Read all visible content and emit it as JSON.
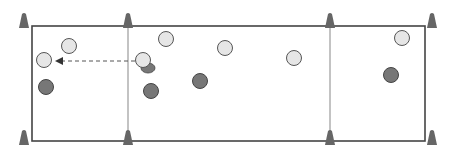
{
  "diagram": {
    "title": "",
    "colors": {
      "field_border": "#444444",
      "zone_divider": "#aaaaaa",
      "cone": "#666666",
      "light_player": "#e6e6e6",
      "light_player_stroke": "#555555",
      "dark_player": "#777777",
      "dark_player_stroke": "#444444",
      "arrow": "#555555"
    },
    "field": {
      "x": 32,
      "y": 26,
      "width": 393,
      "height": 115
    },
    "dividers": [
      128,
      330
    ],
    "cones": [
      {
        "x": 24,
        "y": 20
      },
      {
        "x": 128,
        "y": 20
      },
      {
        "x": 330,
        "y": 20
      },
      {
        "x": 432,
        "y": 20
      },
      {
        "x": 24,
        "y": 137
      },
      {
        "x": 128,
        "y": 137
      },
      {
        "x": 330,
        "y": 137
      },
      {
        "x": 432,
        "y": 137
      }
    ],
    "light_players": [
      {
        "x": 69,
        "y": 46
      },
      {
        "x": 44,
        "y": 60
      },
      {
        "x": 143,
        "y": 60
      },
      {
        "x": 166,
        "y": 39
      },
      {
        "x": 225,
        "y": 48
      },
      {
        "x": 294,
        "y": 58
      },
      {
        "x": 402,
        "y": 38
      }
    ],
    "dark_players": [
      {
        "x": 46,
        "y": 87
      },
      {
        "x": 151,
        "y": 91
      },
      {
        "x": 200,
        "y": 81
      },
      {
        "x": 391,
        "y": 75
      }
    ],
    "ball": {
      "x": 148,
      "y": 68
    },
    "pass_arrow": {
      "from": {
        "x": 135,
        "y": 61
      },
      "to": {
        "x": 57,
        "y": 61
      },
      "style": "dashed"
    }
  }
}
